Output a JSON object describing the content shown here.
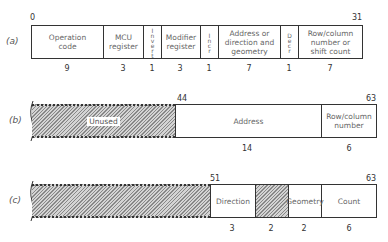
{
  "panels": [
    {
      "id": "a",
      "label": "(a)",
      "start_bit": "0",
      "end_bit": "31",
      "fields": [
        {
          "name": "Operation\ncode",
          "width": "9"
        },
        {
          "name": "MCU\nregister",
          "width": "3"
        },
        {
          "name": "Invert",
          "width": "1"
        },
        {
          "name": "Modifier\nregister",
          "width": "3"
        },
        {
          "name": "Incr",
          "width": "1"
        },
        {
          "name": "Address or\ndirection and\ngeometry",
          "width": "7"
        },
        {
          "name": "Decr",
          "width": "1"
        },
        {
          "name": "Row/column\nnumber or\nshift count",
          "width": "7"
        }
      ]
    },
    {
      "id": "b",
      "label": "(b)",
      "mid_bit": "44",
      "end_bit": "63",
      "fields": [
        {
          "name": "Unused",
          "width": "",
          "hatched": true
        },
        {
          "name": "Address",
          "width": "14"
        },
        {
          "name": "Row/column\nnumber",
          "width": "6"
        }
      ]
    },
    {
      "id": "c",
      "label": "(c)",
      "mid_bit": "51",
      "end_bit": "63",
      "fields": [
        {
          "name": "",
          "width": "",
          "hatched": true
        },
        {
          "name": "Direction",
          "width": "3"
        },
        {
          "name": "",
          "width": "2",
          "hatched": true
        },
        {
          "name": "Geometry",
          "width": "2"
        },
        {
          "name": "Count",
          "width": "6"
        }
      ]
    }
  ]
}
